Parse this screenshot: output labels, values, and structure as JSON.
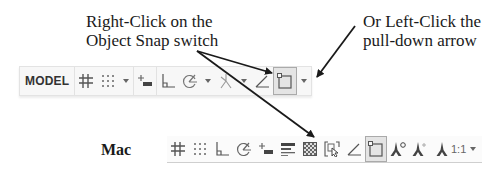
{
  "annotations": {
    "left_callout": [
      "Right-Click on the",
      "Object Snap switch"
    ],
    "right_callout": [
      "Or Left-Click the",
      "pull-down arrow"
    ],
    "mac_label": "Mac"
  },
  "windows_toolbar": {
    "model_label": "MODEL",
    "items": [
      {
        "name": "grid-display",
        "icon": "grid-icon"
      },
      {
        "name": "snap-mode",
        "icon": "snap-dots-icon",
        "has_dropdown": true
      },
      {
        "name": "dynamic-input",
        "icon": "dynamic-input-icon"
      },
      {
        "name": "ortho-mode",
        "icon": "ortho-icon"
      },
      {
        "name": "polar-tracking",
        "icon": "polar-tracking-icon",
        "has_dropdown": true
      },
      {
        "name": "isometric-drafting",
        "icon": "isodraft-icon",
        "has_dropdown": true
      },
      {
        "name": "object-snap-tracking",
        "icon": "snap-tracking-icon"
      },
      {
        "name": "object-snap",
        "icon": "object-snap-icon",
        "active": true,
        "has_dropdown": true
      }
    ]
  },
  "mac_toolbar": {
    "items": [
      {
        "name": "grid-display",
        "icon": "grid-icon"
      },
      {
        "name": "snap-mode",
        "icon": "snap-dots-icon"
      },
      {
        "name": "ortho-mode",
        "icon": "ortho-icon"
      },
      {
        "name": "polar-tracking",
        "icon": "polar-tracking-icon"
      },
      {
        "name": "dynamic-input",
        "icon": "dynamic-input-icon"
      },
      {
        "name": "lineweight",
        "icon": "lineweight-icon"
      },
      {
        "name": "transparency",
        "icon": "transparency-icon"
      },
      {
        "name": "selection-cycling",
        "icon": "selection-cycling-icon"
      },
      {
        "name": "object-snap-tracking",
        "icon": "snap-tracking-icon"
      },
      {
        "name": "object-snap",
        "icon": "object-snap-icon",
        "active": true
      },
      {
        "name": "annotation-visibility",
        "icon": "annotation-visibility-icon"
      },
      {
        "name": "auto-scale",
        "icon": "auto-scale-icon"
      },
      {
        "name": "annotation-scale",
        "icon": "annotation-scale-icon"
      }
    ],
    "annotation_scale_value": "1:1"
  },
  "colors": {
    "toolbar_bg": "#f7f7f7",
    "icon": "#555555",
    "active_bg": "#e4e4e4",
    "arrow": "#1a1a1a"
  }
}
